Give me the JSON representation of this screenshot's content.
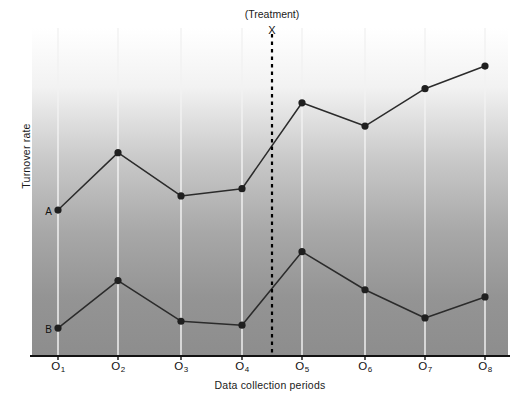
{
  "chart_data": {
    "type": "line",
    "title": "",
    "xlabel": "Data collection periods",
    "ylabel": "Turnover rate",
    "categories": [
      "O1",
      "O2",
      "O3",
      "O4",
      "O5",
      "O6",
      "O7",
      "O8"
    ],
    "tick_labels": [
      "O",
      "O",
      "O",
      "O",
      "O",
      "O",
      "O",
      "O"
    ],
    "tick_subscripts": [
      "1",
      "2",
      "3",
      "4",
      "5",
      "6",
      "7",
      "8"
    ],
    "grid": true,
    "legend_position": "inline-start-labels",
    "ylim": [
      0,
      100
    ],
    "xlim": [
      0.5,
      8.5
    ],
    "axis_ticks_visible": false,
    "series": [
      {
        "name": "A",
        "label": "A",
        "marker": "filled-circle",
        "values": [
          44.5,
          62.0,
          48.8,
          51.0,
          77.2,
          70.1,
          81.5,
          88.4
        ],
        "pixel_y": [
          210,
          153,
          196,
          189,
          103,
          126,
          89,
          66
        ]
      },
      {
        "name": "B",
        "label": "B",
        "marker": "filled-circle",
        "values": [
          8.5,
          23.0,
          10.6,
          9.4,
          31.8,
          20.2,
          11.6,
          18.0
        ],
        "pixel_y": [
          328,
          281,
          320,
          324,
          252,
          290,
          318,
          297
        ]
      }
    ],
    "annotations": [
      {
        "name": "treatment-marker",
        "caption": "(Treatment)",
        "symbol": "X",
        "x_position": 4.5,
        "style": "vertical-dashed-line"
      }
    ]
  },
  "colors": {
    "line": "#2b2b2b",
    "marker": "#1f1f1f",
    "gridline": "#f2f2f2",
    "axis": "#111111",
    "treatment_line": "#000000",
    "plot_top": "#ffffff",
    "plot_bottom": "#8c8c8c",
    "text": "#111111"
  },
  "layout": {
    "plot_left": 32,
    "plot_right": 508,
    "plot_top": 28,
    "plot_bottom": 356,
    "gridline_x": [
      58,
      118,
      181,
      242,
      302,
      365,
      425,
      485
    ],
    "treatment_x": 272
  }
}
